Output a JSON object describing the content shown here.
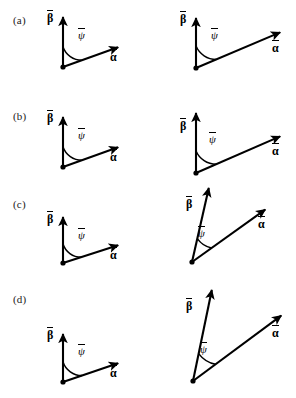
{
  "figure": {
    "background_color": "#ffffff",
    "stroke_color": "#000000",
    "width": 296,
    "height": 398,
    "rows": [
      {
        "id": "a",
        "row_label": "(a)",
        "label_x": 13,
        "label_y": 14,
        "panels": [
          {
            "id": "a-left",
            "origin": [
              63,
              67
            ],
            "beta_tip": [
              63,
              16
            ],
            "alpha_tip": [
              119,
              47
            ],
            "angle_radius": 20,
            "beta_label": {
              "glyph": "β",
              "x": 47,
              "y": 10
            },
            "alpha_label": {
              "glyph": "α",
              "x": 110,
              "y": 49
            },
            "psi_label": {
              "glyph": "ψ",
              "x": 78,
              "y": 28
            },
            "angle_value_deg": 119
          },
          {
            "id": "a-right",
            "origin": [
              196,
              68
            ],
            "beta_tip": [
              196,
              17
            ],
            "alpha_tip": [
              281,
              32
            ],
            "angle_radius": 22,
            "beta_label": {
              "glyph": "β",
              "x": 180,
              "y": 11
            },
            "alpha_label": {
              "glyph": "α",
              "x": 272,
              "y": 40
            },
            "psi_label": {
              "glyph": "ψ",
              "x": 211,
              "y": 28
            },
            "angle_value_deg": 100
          }
        ]
      },
      {
        "id": "b",
        "row_label": "(b)",
        "label_x": 13,
        "label_y": 110,
        "panels": [
          {
            "id": "b-left",
            "origin": [
              63,
              167
            ],
            "beta_tip": [
              63,
              116
            ],
            "alpha_tip": [
              119,
              147
            ],
            "angle_radius": 20,
            "beta_label": {
              "glyph": "β",
              "x": 47,
              "y": 110
            },
            "alpha_label": {
              "glyph": "α",
              "x": 110,
              "y": 149
            },
            "psi_label": {
              "glyph": "ψ",
              "x": 78,
              "y": 128
            },
            "angle_value_deg": 119
          },
          {
            "id": "b-right",
            "origin": [
              196,
              173
            ],
            "beta_tip": [
              196,
              112
            ],
            "alpha_tip": [
              281,
              136
            ],
            "angle_radius": 22,
            "beta_label": {
              "glyph": "β",
              "x": 180,
              "y": 118
            },
            "alpha_label": {
              "glyph": "α",
              "x": 272,
              "y": 143
            },
            "psi_label": {
              "glyph": "ψ",
              "x": 209,
              "y": 132
            },
            "angle_value_deg": 106
          }
        ]
      },
      {
        "id": "c",
        "row_label": "(c)",
        "label_x": 13,
        "label_y": 198,
        "panels": [
          {
            "id": "c-left",
            "origin": [
              63,
              263
            ],
            "beta_tip": [
              63,
              216
            ],
            "alpha_tip": [
              119,
              245
            ],
            "angle_radius": 19,
            "beta_label": {
              "glyph": "β",
              "x": 47,
              "y": 211
            },
            "alpha_label": {
              "glyph": "α",
              "x": 110,
              "y": 247
            },
            "psi_label": {
              "glyph": "ψ",
              "x": 78,
              "y": 228
            },
            "angle_value_deg": 117
          },
          {
            "id": "c-right",
            "origin": [
              192,
              262
            ],
            "beta_tip": [
              209,
              187
            ],
            "alpha_tip": [
              266,
              209
            ],
            "angle_radius": 24,
            "beta_label": {
              "glyph": "β",
              "x": 186,
              "y": 196
            },
            "alpha_label": {
              "glyph": "α",
              "x": 258,
              "y": 216
            },
            "psi_label": {
              "glyph": "ψ",
              "x": 198,
              "y": 226
            },
            "angle_value_deg": 56
          }
        ]
      },
      {
        "id": "d",
        "row_label": "(d)",
        "label_x": 13,
        "label_y": 293,
        "panels": [
          {
            "id": "d-left",
            "origin": [
              63,
              382
            ],
            "beta_tip": [
              63,
              333
            ],
            "alpha_tip": [
              119,
              363
            ],
            "angle_radius": 20,
            "beta_label": {
              "glyph": "β",
              "x": 47,
              "y": 327
            },
            "alpha_label": {
              "glyph": "α",
              "x": 110,
              "y": 365
            },
            "psi_label": {
              "glyph": "ψ",
              "x": 78,
              "y": 344
            },
            "angle_value_deg": 118
          },
          {
            "id": "d-right",
            "origin": [
              193,
              381
            ],
            "beta_tip": [
              212,
              289
            ],
            "alpha_tip": [
              282,
              315
            ],
            "angle_radius": 28,
            "beta_label": {
              "glyph": "β",
              "x": 186,
              "y": 298
            },
            "alpha_label": {
              "glyph": "α",
              "x": 272,
              "y": 325
            },
            "psi_label": {
              "glyph": "ψ",
              "x": 200,
              "y": 342
            },
            "angle_value_deg": 58
          }
        ]
      }
    ]
  }
}
